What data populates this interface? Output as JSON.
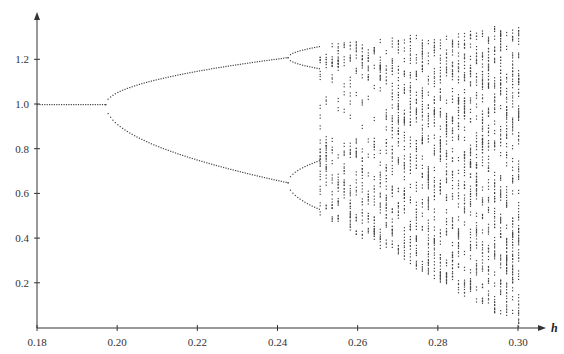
{
  "chart_data": {
    "type": "scatter",
    "title": "",
    "xlabel": "h",
    "ylabel": "",
    "xlim": [
      0.18,
      0.3
    ],
    "ylim": [
      0.0,
      1.38
    ],
    "x_ticks": [
      "0.18",
      "0.20",
      "0.22",
      "0.24",
      "0.26",
      "0.28",
      "0.30"
    ],
    "y_ticks": [
      "0.2",
      "0.4",
      "0.6",
      "0.8",
      "1.0",
      "1.2"
    ],
    "grid": false,
    "legend": null,
    "key_points": [
      {
        "h": 0.18,
        "y": [
          1.0
        ]
      },
      {
        "h": 0.197,
        "y": [
          1.0
        ]
      },
      {
        "h": 0.22,
        "y": [
          1.16,
          0.83
        ]
      },
      {
        "h": 0.242,
        "y": [
          1.21,
          0.65
        ]
      },
      {
        "h": 0.25,
        "y": [
          1.26,
          1.16,
          0.75,
          0.53
        ]
      },
      {
        "h": 0.3,
        "y_range": [
          0.02,
          1.36
        ]
      }
    ]
  }
}
